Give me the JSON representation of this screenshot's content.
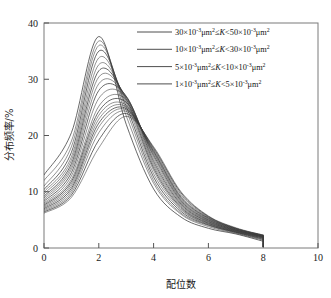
{
  "chart_data": {
    "type": "line",
    "title": "",
    "subtitle": "",
    "xlabel": "配位数",
    "ylabel": "分布频率/%",
    "xlim": [
      0,
      10
    ],
    "ylim": [
      0,
      40
    ],
    "xticks": [
      0,
      2,
      4,
      6,
      8,
      10
    ],
    "yticks": [
      0,
      10,
      20,
      30,
      40
    ],
    "xtick_labels": [
      "0",
      "2",
      "4",
      "6",
      "8",
      "10"
    ],
    "ytick_labels": [
      "0",
      "10",
      "20",
      "30",
      "40"
    ],
    "grid": false,
    "legend_position": "top-right",
    "line_color": "#3a3a3a",
    "x": [
      0,
      1,
      2,
      3,
      4,
      5,
      6,
      7,
      8
    ],
    "series": [
      {
        "name": "g01",
        "group": 1,
        "values": [
          13.0,
          20.5,
          37.6,
          22.0,
          10.5,
          5.5,
          3.5,
          2.5,
          1.2
        ]
      },
      {
        "name": "g02",
        "group": 1,
        "values": [
          12.0,
          19.0,
          36.8,
          23.5,
          11.5,
          6.0,
          3.8,
          2.6,
          1.4
        ]
      },
      {
        "name": "g03",
        "group": 1,
        "values": [
          11.0,
          18.0,
          36.0,
          24.5,
          12.0,
          6.2,
          4.0,
          2.7,
          1.5
        ]
      },
      {
        "name": "g04",
        "group": 1,
        "values": [
          10.4,
          17.0,
          35.0,
          25.2,
          12.6,
          6.5,
          4.1,
          2.8,
          1.6
        ]
      },
      {
        "name": "g05",
        "group": 2,
        "values": [
          10.0,
          16.2,
          33.8,
          25.8,
          13.2,
          6.8,
          4.2,
          2.8,
          1.7
        ]
      },
      {
        "name": "g06",
        "group": 2,
        "values": [
          9.6,
          15.6,
          32.6,
          26.2,
          13.8,
          7.0,
          4.3,
          2.9,
          1.8
        ]
      },
      {
        "name": "g07",
        "group": 2,
        "values": [
          9.2,
          15.0,
          31.5,
          26.5,
          14.2,
          7.2,
          4.4,
          2.9,
          1.8
        ]
      },
      {
        "name": "g08",
        "group": 2,
        "values": [
          8.9,
          14.5,
          30.4,
          26.8,
          14.6,
          7.4,
          4.5,
          3.0,
          1.9
        ]
      },
      {
        "name": "g09",
        "group": 2,
        "values": [
          8.6,
          14.0,
          29.2,
          26.9,
          15.0,
          7.6,
          4.6,
          3.0,
          1.9
        ]
      },
      {
        "name": "g10",
        "group": 3,
        "values": [
          8.3,
          13.4,
          28.0,
          27.0,
          15.4,
          7.8,
          4.7,
          3.1,
          2.0
        ]
      },
      {
        "name": "g11",
        "group": 3,
        "values": [
          8.0,
          12.8,
          26.6,
          26.8,
          15.8,
          8.0,
          4.8,
          3.1,
          2.0
        ]
      },
      {
        "name": "g12",
        "group": 3,
        "values": [
          7.8,
          12.2,
          25.2,
          26.4,
          16.2,
          8.2,
          4.9,
          3.2,
          2.0
        ]
      },
      {
        "name": "g13",
        "group": 3,
        "values": [
          7.6,
          11.8,
          24.3,
          25.9,
          16.5,
          8.4,
          5.0,
          3.2,
          2.1
        ]
      },
      {
        "name": "g14",
        "group": 3,
        "values": [
          7.4,
          11.4,
          23.6,
          25.4,
          16.8,
          8.6,
          5.1,
          3.3,
          2.1
        ]
      },
      {
        "name": "g15",
        "group": 4,
        "values": [
          7.2,
          11.0,
          22.9,
          25.1,
          17.0,
          8.8,
          5.2,
          3.3,
          2.1
        ]
      },
      {
        "name": "g16",
        "group": 4,
        "values": [
          7.0,
          10.6,
          22.2,
          24.8,
          17.2,
          9.0,
          5.3,
          3.4,
          2.2
        ]
      },
      {
        "name": "g17",
        "group": 4,
        "values": [
          6.8,
          10.2,
          21.5,
          24.6,
          17.4,
          9.2,
          5.4,
          3.4,
          2.2
        ]
      },
      {
        "name": "g18",
        "group": 4,
        "values": [
          6.6,
          9.8,
          20.5,
          24.3,
          17.6,
          9.5,
          5.5,
          3.5,
          2.2
        ]
      },
      {
        "name": "g19",
        "group": 4,
        "values": [
          6.4,
          9.4,
          19.2,
          23.9,
          17.8,
          9.8,
          5.6,
          3.5,
          2.3
        ]
      },
      {
        "name": "g20",
        "group": 4,
        "values": [
          6.2,
          9.0,
          17.8,
          23.4,
          18.0,
          10.0,
          5.7,
          3.6,
          2.3
        ]
      }
    ],
    "legend": [
      {
        "id": "k30-50",
        "text": "30×10⁻³μm²≤K<50×10⁻³μm²"
      },
      {
        "id": "k10-30",
        "text": "10×10⁻³μm²≤K<30×10⁻³μm²"
      },
      {
        "id": "k5-10",
        "text": "5×10⁻³μm²≤K<10×10⁻³μm²"
      },
      {
        "id": "k1-5",
        "text": "1×10⁻³μm²≤K<5×10⁻³μm²"
      }
    ],
    "legend_parts": [
      {
        "id": "k30-50",
        "a": "30×10",
        "sup1": "-3",
        "u1": "μm",
        "sup2": "2",
        "rel": "≤",
        "k": "K",
        "lt": "<",
        "b": "50×10",
        "sup3": "-3",
        "u2": "μm",
        "sup4": "2"
      },
      {
        "id": "k10-30",
        "a": "10×10",
        "sup1": "-3",
        "u1": "μm",
        "sup2": "2",
        "rel": "≤",
        "k": "K",
        "lt": "<",
        "b": "30×10",
        "sup3": "-3",
        "u2": "μm",
        "sup4": "2"
      },
      {
        "id": "k5-10",
        "a": "5×10",
        "sup1": "-3",
        "u1": "μm",
        "sup2": "2",
        "rel": "≤",
        "k": "K",
        "lt": "<",
        "b": "10×10",
        "sup3": "-3",
        "u2": "μm",
        "sup4": "2"
      },
      {
        "id": "k1-5",
        "a": "1×10",
        "sup1": "-3",
        "u1": "μm",
        "sup2": "2",
        "rel": "≤",
        "k": "K",
        "lt": "<",
        "b": "5×10",
        "sup3": "-3",
        "u2": "μm",
        "sup4": "2"
      }
    ]
  }
}
